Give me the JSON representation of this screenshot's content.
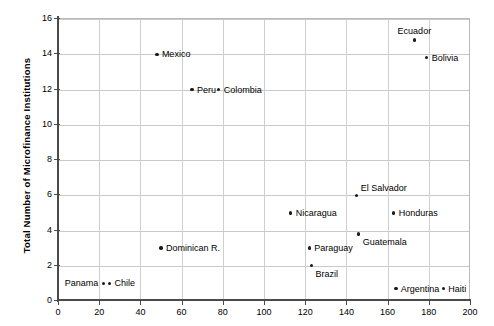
{
  "chart_data": {
    "type": "scatter",
    "title": "",
    "xlabel": "",
    "ylabel": "Total Number of Microfinance Institutions",
    "xlim": [
      0,
      200
    ],
    "ylim": [
      0,
      16
    ],
    "xticks": [
      0,
      20,
      40,
      60,
      80,
      100,
      120,
      140,
      160,
      180,
      200
    ],
    "yticks": [
      0,
      2,
      4,
      6,
      8,
      10,
      12,
      14,
      16
    ],
    "grid": true,
    "legend": "none",
    "point_color": "#1a1a1a",
    "grid_color": "#c9c9c9",
    "axis_color": "#4a4a4a",
    "points": [
      {
        "label": "Ecuador",
        "x": 173,
        "y": 14.8,
        "label_pos": "above"
      },
      {
        "label": "Bolivia",
        "x": 179,
        "y": 13.8,
        "label_pos": "right"
      },
      {
        "label": "Mexico",
        "x": 48,
        "y": 14.0,
        "label_pos": "right"
      },
      {
        "label": "Peru",
        "x": 65,
        "y": 12.0,
        "label_pos": "right"
      },
      {
        "label": "Colombia",
        "x": 78,
        "y": 12.0,
        "label_pos": "right"
      },
      {
        "label": "El Salvador",
        "x": 145,
        "y": 6.0,
        "label_pos": "above-right"
      },
      {
        "label": "Nicaragua",
        "x": 113,
        "y": 5.0,
        "label_pos": "right"
      },
      {
        "label": "Honduras",
        "x": 163,
        "y": 5.0,
        "label_pos": "right"
      },
      {
        "label": "Guatemala",
        "x": 146,
        "y": 3.8,
        "label_pos": "below-right"
      },
      {
        "label": "Dominican R.",
        "x": 50,
        "y": 3.0,
        "label_pos": "right"
      },
      {
        "label": "Paraguay",
        "x": 122,
        "y": 3.0,
        "label_pos": "right"
      },
      {
        "label": "Brazil",
        "x": 123,
        "y": 2.0,
        "label_pos": "below-right"
      },
      {
        "label": "Panama",
        "x": 22,
        "y": 1.0,
        "label_pos": "left"
      },
      {
        "label": "Chile",
        "x": 25,
        "y": 1.0,
        "label_pos": "right"
      },
      {
        "label": "Argentina",
        "x": 164,
        "y": 0.7,
        "label_pos": "right"
      },
      {
        "label": "Haiti",
        "x": 187,
        "y": 0.7,
        "label_pos": "right"
      }
    ]
  }
}
